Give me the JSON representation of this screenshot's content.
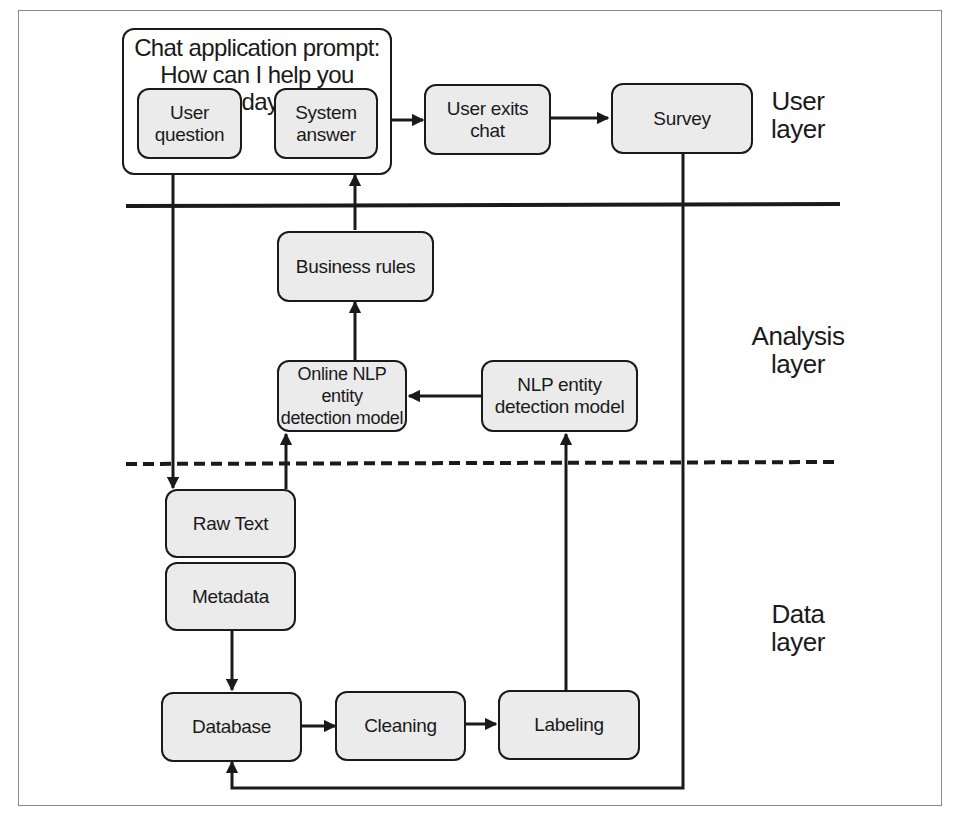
{
  "diagram": {
    "chat_container": {
      "title": "Chat application prompt:\nHow can I help you today?"
    },
    "nodes": {
      "user_question": "User\nquestion",
      "system_answer": "System\nanswer",
      "user_exits_chat": "User exits\nchat",
      "survey": "Survey",
      "business_rules": "Business rules",
      "online_nlp_model": "Online NLP entity\ndetection model",
      "nlp_model": "NLP entity\ndetection model",
      "raw_text": "Raw Text",
      "metadata": "Metadata",
      "database": "Database",
      "cleaning": "Cleaning",
      "labeling": "Labeling"
    },
    "layers": {
      "user": "User\nlayer",
      "analysis": "Analysis\nlayer",
      "data": "Data\nlayer"
    },
    "edges": [
      {
        "from": "System answer",
        "to": "User question"
      },
      {
        "from": "Chat application prompt",
        "to": "User exits chat"
      },
      {
        "from": "User exits chat",
        "to": "Survey"
      },
      {
        "from": "User question",
        "to": "Raw Text"
      },
      {
        "from": "Raw Text",
        "to": "Online NLP entity detection model"
      },
      {
        "from": "NLP entity detection model",
        "to": "Online NLP entity detection model"
      },
      {
        "from": "Online NLP entity detection model",
        "to": "Business rules"
      },
      {
        "from": "Business rules",
        "to": "System answer"
      },
      {
        "from": "Metadata",
        "to": "Database"
      },
      {
        "from": "Database",
        "to": "Cleaning"
      },
      {
        "from": "Cleaning",
        "to": "Labeling"
      },
      {
        "from": "Labeling",
        "to": "NLP entity detection model"
      },
      {
        "from": "Survey",
        "to": "Database"
      }
    ],
    "colors": {
      "box_fill": "#ebebeb",
      "stroke": "#1a1a1a"
    }
  }
}
